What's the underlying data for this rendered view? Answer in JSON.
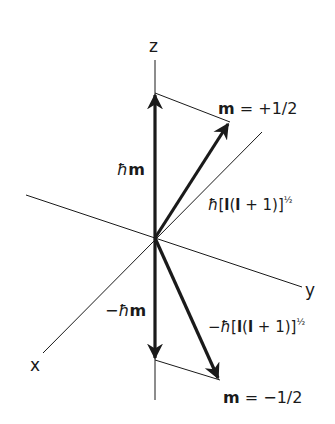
{
  "figure": {
    "axes": {
      "z_label": "z",
      "y_label": "y",
      "x_label": "x"
    },
    "labels": {
      "m_plus": {
        "symbol": "m",
        "equals": " = +1/2"
      },
      "m_minus": {
        "symbol": "m",
        "equals": " = −1/2"
      },
      "hbar_m_up": {
        "hbar": "ħ",
        "symbol": "m"
      },
      "hbar_m_down": {
        "prefix": "−",
        "hbar": "ħ",
        "symbol": "m"
      },
      "magnitude_up": {
        "hbar": "ħ",
        "open": "[",
        "l1": "l",
        "mid": "(",
        "l2": "l",
        "rest": " + 1)]",
        "exponent": "½"
      },
      "magnitude_down": {
        "prefix": "−",
        "hbar": "ħ",
        "open": "[",
        "l1": "l",
        "mid": "(",
        "l2": "l",
        "rest": " + 1)]",
        "exponent": "½"
      }
    },
    "colors": {
      "line": "#1a1a1a",
      "background": "#ffffff"
    }
  }
}
